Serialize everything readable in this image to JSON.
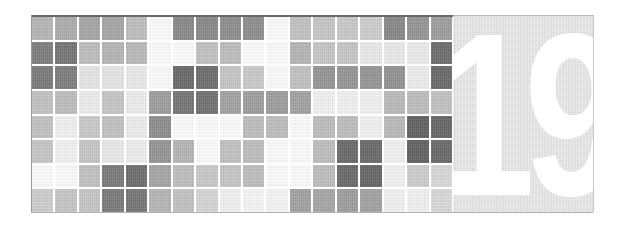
{
  "chapter": {
    "number": "19"
  },
  "mosaic": {
    "rows": 8,
    "columns": 18,
    "shades": [
      [
        "#b8b8b8",
        "#b0b0b0",
        "#a8a8a8",
        "#a8a8a8",
        "#c0c0c0",
        "#ffffff",
        "#8c8c8c",
        "#8c8c8c",
        "#909090",
        "#909090",
        "#ffffff",
        "#c4c4c4",
        "#c8c8c8",
        "#cccccc",
        "#d0d0d0",
        "#8a8a8a",
        "#989898",
        "#a0a0a0"
      ],
      [
        "#808080",
        "#787878",
        "#c0c0c0",
        "#b8b8b8",
        "#bcbcbc",
        "#ffffff",
        "#ffffff",
        "#c4c4c4",
        "#c0c0c0",
        "#ffffff",
        "#ffffff",
        "#b8b8b8",
        "#c8c8c8",
        "#c8c8c8",
        "#ececec",
        "#ececec",
        "#eeeeee",
        "#707070"
      ],
      [
        "#7c7c7c",
        "#808080",
        "#e8e8e8",
        "#e8e8e8",
        "#ececec",
        "#ffffff",
        "#6c6c6c",
        "#707070",
        "#c8c8c8",
        "#cccccc",
        "#ffffff",
        "#c4c4c4",
        "#989898",
        "#989898",
        "#989898",
        "#949494",
        "#f0f0f0",
        "#6c6c6c"
      ],
      [
        "#c4c4c4",
        "#c0c0c0",
        "#f0f0f0",
        "#c8c8c8",
        "#f0f0f0",
        "#a0a0a0",
        "#787878",
        "#747474",
        "#a4a4a4",
        "#a0a0a0",
        "#a0a0a0",
        "#a4a4a4",
        "#f4f4f4",
        "#f4f4f4",
        "#f4f4f4",
        "#bcbcbc",
        "#c0c0c0",
        "#c4c4c4"
      ],
      [
        "#c4c4c4",
        "#f4f4f4",
        "#cccccc",
        "#c4c4c4",
        "#f0f0f0",
        "#909090",
        "#ffffff",
        "#ffffff",
        "#ffffff",
        "#c0c0c0",
        "#c0c0c0",
        "#ffffff",
        "#c0c0c0",
        "#c0c0c0",
        "#f4f4f4",
        "#bcbcbc",
        "#646464",
        "#686868"
      ],
      [
        "#c8c8c8",
        "#f4f4f4",
        "#c8c8c8",
        "#ececec",
        "#f0f0f0",
        "#989898",
        "#b8b8b8",
        "#ffffff",
        "#c4c4c4",
        "#c0c0c0",
        "#ffffff",
        "#ffffff",
        "#c0c0c0",
        "#6c6c6c",
        "#6c6c6c",
        "#f4f4f4",
        "#646464",
        "#6c6c6c"
      ],
      [
        "#ffffff",
        "#ffffff",
        "#c4c4c4",
        "#7c7c7c",
        "#707070",
        "#a8a8a8",
        "#c0c0c0",
        "#cccccc",
        "#c8c8c8",
        "#c0c0c0",
        "#ffffff",
        "#ffffff",
        "#c0c0c0",
        "#6c6c6c",
        "#686868",
        "#f4f4f4",
        "#d0d0d0",
        "#dcdcdc"
      ],
      [
        "#d0d0d0",
        "#c8c8c8",
        "#c8c8c8",
        "#7c7c7c",
        "#787878",
        "#b8b8b8",
        "#c4c4c4",
        "#d8d8d8",
        "#f4f4f4",
        "#f8f8f8",
        "#f8f8f8",
        "#a4a4a4",
        "#a8a8a8",
        "#a0a0a0",
        "#a4a4a4",
        "#f4f4f4",
        "#f4f4f4",
        "#dcdcdc"
      ]
    ]
  },
  "colors": {
    "panel_background": "#e3e3e3",
    "number_color": "#ffffff",
    "frame_top": "#6a6a6a"
  }
}
